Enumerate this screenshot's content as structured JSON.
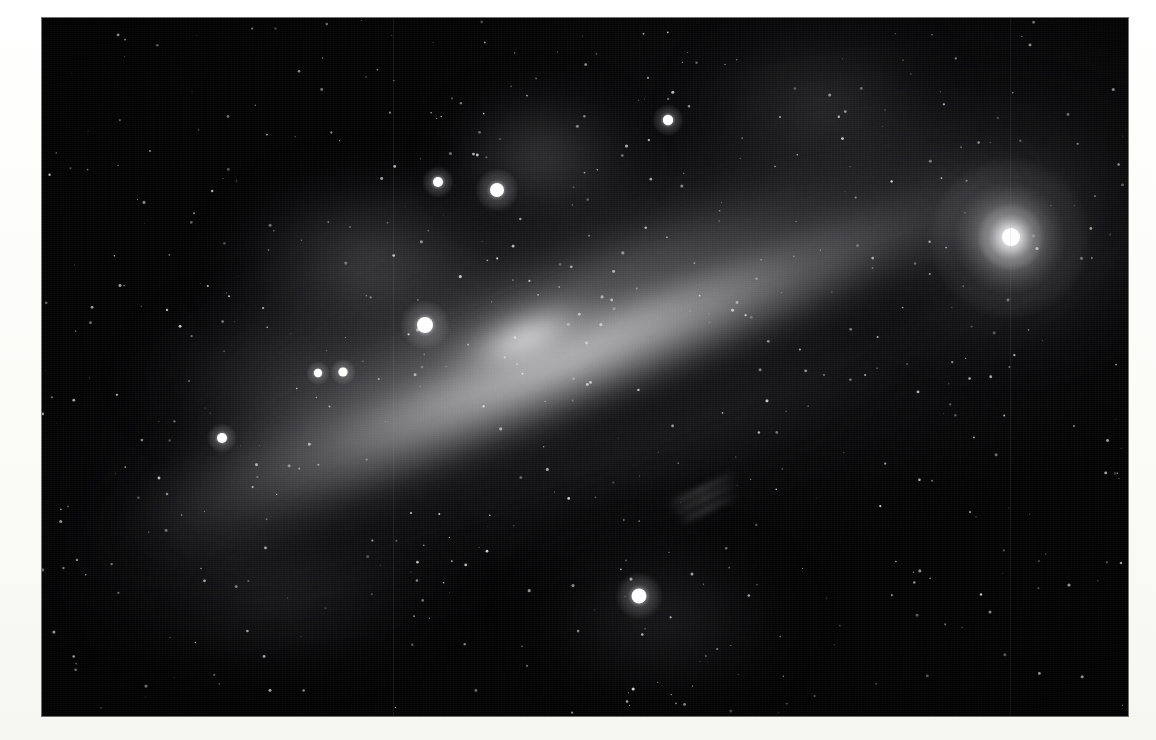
{
  "image": {
    "title": "Edge-on spiral galaxy photographic plate",
    "kind": "astronomical-photograph",
    "palette": "grayscale",
    "border_color": "#fcfcfa",
    "sky_color": "#030304",
    "plate": {
      "x": 42,
      "y": 18,
      "width": 1086,
      "height": 698
    }
  },
  "scene": {
    "galaxy": {
      "name": "edge-on-spiral-galaxy",
      "position_angle_deg": -22,
      "center": {
        "x": 546,
        "y": 346
      },
      "disk_length": 1120,
      "disk_thickness": 250,
      "nucleus": {
        "x": 490,
        "y": 366,
        "width": 180,
        "height": 70,
        "brightness": "#ececec"
      },
      "dust_lane": "dark diagonal band along lower disk edge"
    },
    "bright_knot": {
      "name": "nebula-knot-upper-right",
      "x": 1010,
      "y": 238,
      "radius": 34,
      "color": "#ffffff"
    },
    "seams": [
      393,
      1010
    ],
    "nebulosity": [
      {
        "name": "cloud-upper-left-arc",
        "x": 330,
        "y": 250,
        "rx": 180,
        "ry": 120,
        "alpha": 0.3
      },
      {
        "name": "cloud-upper-filament",
        "x": 500,
        "y": 140,
        "rx": 120,
        "ry": 90,
        "alpha": 0.26
      },
      {
        "name": "cloud-mid-left",
        "x": 260,
        "y": 360,
        "rx": 190,
        "ry": 110,
        "alpha": 0.22
      },
      {
        "name": "cloud-right-sheet",
        "x": 960,
        "y": 210,
        "rx": 200,
        "ry": 160,
        "alpha": 0.24
      },
      {
        "name": "cloud-lower-left-haze",
        "x": 230,
        "y": 560,
        "rx": 220,
        "ry": 130,
        "alpha": 0.14
      },
      {
        "name": "cloud-lower-center",
        "x": 620,
        "y": 600,
        "rx": 170,
        "ry": 110,
        "alpha": 0.12
      },
      {
        "name": "cloud-top-streak",
        "x": 780,
        "y": 90,
        "rx": 160,
        "ry": 110,
        "alpha": 0.16
      }
    ],
    "bright_stars": [
      {
        "name": "star-a",
        "x": 438,
        "y": 182,
        "r": 5.0,
        "glow": 16
      },
      {
        "name": "star-b",
        "x": 497,
        "y": 190,
        "r": 7.0,
        "glow": 22
      },
      {
        "name": "star-c",
        "x": 425,
        "y": 325,
        "r": 8.0,
        "glow": 25
      },
      {
        "name": "star-d",
        "x": 318,
        "y": 373,
        "r": 4.2,
        "glow": 12
      },
      {
        "name": "star-e",
        "x": 343,
        "y": 372,
        "r": 4.6,
        "glow": 13
      },
      {
        "name": "star-f",
        "x": 222,
        "y": 438,
        "r": 5.0,
        "glow": 15
      },
      {
        "name": "star-g",
        "x": 668,
        "y": 120,
        "r": 5.2,
        "glow": 16
      },
      {
        "name": "star-h",
        "x": 639,
        "y": 596,
        "r": 7.5,
        "glow": 24
      },
      {
        "name": "star-i",
        "x": 1011,
        "y": 237,
        "r": 9.0,
        "glow": 34
      }
    ],
    "streaks": [
      {
        "name": "arm-streak-1",
        "x": 660,
        "y": 470,
        "length": 78,
        "angle": -26
      },
      {
        "name": "arm-streak-2",
        "x": 663,
        "y": 479,
        "length": 72,
        "angle": -26
      },
      {
        "name": "arm-streak-3",
        "x": 666,
        "y": 489,
        "length": 64,
        "angle": -26
      }
    ],
    "star_field": {
      "count": 520,
      "min_radius": 0.4,
      "max_radius": 1.6,
      "color": "#e8e8ea"
    }
  }
}
